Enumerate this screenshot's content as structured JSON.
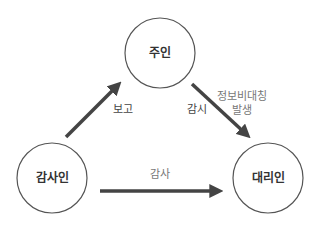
{
  "diagram": {
    "type": "agency-relationship",
    "nodes": [
      {
        "id": "principal",
        "label": "주인",
        "cx": 160,
        "cy": 53,
        "r": 35
      },
      {
        "id": "auditor",
        "label": "감사인",
        "cx": 52,
        "cy": 178,
        "r": 35
      },
      {
        "id": "agent",
        "label": "대리인",
        "cx": 268,
        "cy": 178,
        "r": 35
      }
    ],
    "edges": [
      {
        "from": "auditor",
        "to": "principal",
        "label": "보고"
      },
      {
        "from": "principal",
        "to": "agent",
        "label": "감시",
        "note_line1": "정보비대칭",
        "note_line2": "발생"
      },
      {
        "from": "auditor",
        "to": "agent",
        "label": "감사"
      }
    ]
  },
  "colors": {
    "arrow": "#444444",
    "circle_stroke": "#555555",
    "text": "#333333",
    "note_text": "#777777"
  }
}
